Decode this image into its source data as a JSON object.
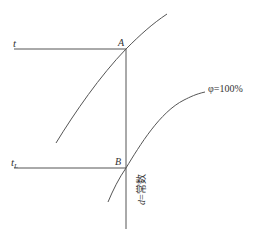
{
  "diagram": {
    "type": "psychrometric-construction",
    "lines": {
      "t_line": {
        "label": "t",
        "y": 49,
        "x1": 14,
        "x2": 126
      },
      "tL_line": {
        "label": "t",
        "subscript": "L",
        "y": 168,
        "x1": 14,
        "x2": 126
      },
      "d_line": {
        "label_var": "d",
        "label_rest": "=常数",
        "x": 126,
        "y1": 49,
        "y2": 229
      }
    },
    "points": {
      "A": {
        "label": "A",
        "x": 126,
        "y": 49
      },
      "B": {
        "label": "B",
        "x": 126,
        "y": 168
      }
    },
    "curves": {
      "upper": {
        "label": ""
      },
      "saturation": {
        "label": "φ=100%"
      }
    },
    "colors": {
      "line": "#555555",
      "text": "#333333",
      "background": "#ffffff"
    }
  }
}
